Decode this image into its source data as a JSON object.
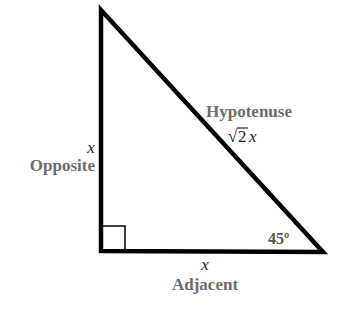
{
  "diagram": {
    "type": "right-triangle-45-45-90",
    "colors": {
      "stroke": "#000000",
      "label": "#6b6b6b",
      "variable": "#222222",
      "angle": "#555555",
      "background": "#ffffff"
    },
    "vertices": {
      "top": [
        101,
        10
      ],
      "bottom_left": [
        101,
        251
      ],
      "bottom_right": [
        323,
        252
      ]
    },
    "right_angle_marker": true,
    "sides": {
      "opposite": {
        "label": "Opposite",
        "length": "x"
      },
      "adjacent": {
        "label": "Adjacent",
        "length": "x"
      },
      "hypotenuse": {
        "label": "Hypotenuse",
        "length_radical": "√",
        "length_radicand": "2",
        "length_var": "x"
      }
    },
    "angle": {
      "label": "45º"
    }
  }
}
